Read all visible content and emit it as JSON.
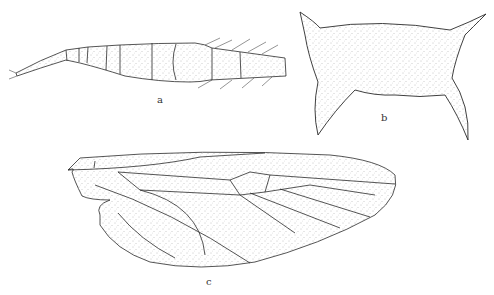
{
  "figure": {
    "panels": [
      {
        "id": "a",
        "label": "a",
        "subject": "antenna"
      },
      {
        "id": "b",
        "label": "b",
        "subject": "body-segment"
      },
      {
        "id": "c",
        "label": "c",
        "subject": "wing"
      }
    ]
  },
  "colors": {
    "line": "#2a2a2a",
    "stipple": "#9a9a9a",
    "background": "#ffffff"
  }
}
